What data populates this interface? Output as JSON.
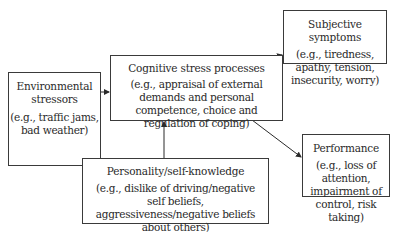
{
  "diagram": {
    "nodes": {
      "environmental": {
        "title": "Environmental stressors",
        "description": "(e.g., traffic jams, bad weather)"
      },
      "cognitive": {
        "title": "Cognitive stress processes",
        "description": "(e.g., appraisal of external demands and personal competence, choice and regulation of coping)"
      },
      "subjective": {
        "title": "Subjective symptoms",
        "description": "(e.g., tiredness, apathy, tension, insecurity, worry)"
      },
      "performance": {
        "title": "Performance",
        "description": "(e.g., loss of attention, impairment of control, risk taking)"
      },
      "personality": {
        "title": "Personality/self-knowledge",
        "description": "(e.g., dislike of driving/negative self beliefs, aggressiveness/negative beliefs about others)"
      }
    },
    "edges": [
      {
        "from": "environmental",
        "to": "cognitive"
      },
      {
        "from": "personality",
        "to": "cognitive"
      },
      {
        "from": "cognitive",
        "to": "subjective"
      },
      {
        "from": "cognitive",
        "to": "performance"
      }
    ],
    "colors": {
      "line": "#2a2a2a",
      "background": "#ffffff"
    }
  }
}
